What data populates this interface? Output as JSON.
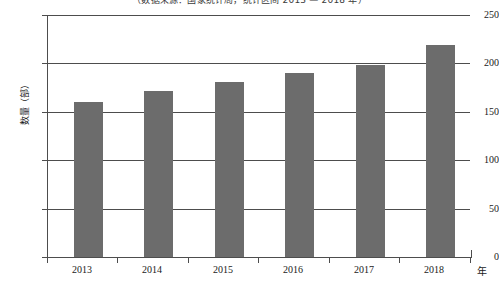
{
  "chart_data": {
    "type": "bar",
    "title": "（数据来源：国家统计局，统计区间 2013 — 2018 年）",
    "subtitle": "",
    "xlabel": "年",
    "ylabel": "数量（部）",
    "categories": [
      "2013",
      "2014",
      "2015",
      "2016",
      "2017",
      "2018"
    ],
    "values": [
      160,
      172,
      181,
      190,
      198,
      219
    ],
    "series": [
      {
        "name": "数量（部）",
        "values": [
          160,
          172,
          181,
          190,
          198,
          219
        ]
      }
    ],
    "ylim": [
      0,
      250
    ],
    "yticks": [
      0,
      50,
      100,
      150,
      200,
      250
    ],
    "ytick_labels": [
      "0",
      "50",
      "100",
      "150",
      "200",
      "250"
    ],
    "grid": true,
    "grid_axis": "y",
    "legend": false,
    "legend_position": "none",
    "bar_color": "#6c6c6c",
    "axis_color": "#4d4d4d",
    "background_color": "#ffffff"
  },
  "axes": {
    "y_unit_label": "数量（部）",
    "x_unit_label": "年"
  }
}
